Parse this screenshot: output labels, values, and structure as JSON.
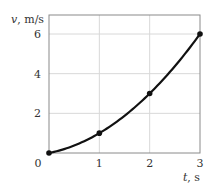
{
  "chart_data": {
    "type": "line",
    "title": "",
    "xlabel": "t, s",
    "ylabel": "v, m/s",
    "xlim": [
      0,
      3
    ],
    "ylim": [
      0,
      6.6
    ],
    "xticks": [
      0,
      1,
      2,
      3
    ],
    "yticks": [
      2,
      4,
      6
    ],
    "xtick_labels": [
      "0",
      "1",
      "2",
      "3"
    ],
    "ytick_labels": [
      "2",
      "4",
      "6"
    ],
    "origin_label": "0",
    "grid": true,
    "series": [
      {
        "name": "v(t)",
        "x": [
          0,
          1,
          2,
          3
        ],
        "values": [
          0,
          1,
          3,
          6
        ],
        "markers": true,
        "smooth": "v = 0.5 t^2 + 0.5 t"
      }
    ]
  }
}
